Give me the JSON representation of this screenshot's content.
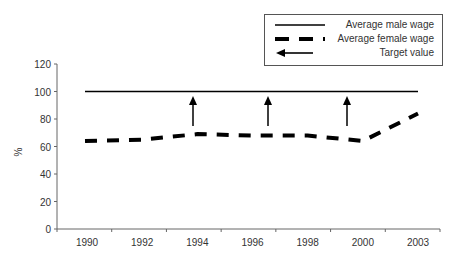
{
  "chart_data": {
    "type": "line",
    "title": "",
    "xlabel": "",
    "ylabel": "%",
    "ylim": [
      0,
      120
    ],
    "yticks": [
      0,
      20,
      40,
      60,
      80,
      100,
      120
    ],
    "categories": [
      "1990",
      "1992",
      "1994",
      "1996",
      "1998",
      "2000",
      "2003"
    ],
    "series": [
      {
        "name": "Average male wage",
        "style": "solid",
        "values": [
          100,
          100,
          100,
          100,
          100,
          100,
          100
        ]
      },
      {
        "name": "Average female wage",
        "style": "dashed",
        "values": [
          64,
          65,
          69,
          68,
          68,
          64,
          84
        ]
      }
    ],
    "annotations": [
      {
        "type": "arrow-up",
        "label": "Target value",
        "x_position": "1994",
        "from": 70,
        "to": 97
      },
      {
        "type": "arrow-up",
        "label": "Target value",
        "x_position": "between 1996 and 1998",
        "from": 70,
        "to": 97
      },
      {
        "type": "arrow-up",
        "label": "Target value",
        "x_position": "between 1998 and 2000",
        "from": 70,
        "to": 97
      }
    ],
    "grid": false,
    "legend_position": "top-right"
  },
  "legend": {
    "items": [
      {
        "label": "Average male wage",
        "icon": "solid-line-icon"
      },
      {
        "label": "Average female wage",
        "icon": "dashed-line-icon"
      },
      {
        "label": "Target value",
        "icon": "left-arrow-icon"
      }
    ]
  },
  "axis": {
    "y_title": "%",
    "y_ticks": [
      "0",
      "20",
      "40",
      "60",
      "80",
      "100",
      "120"
    ],
    "x_ticks": [
      "1990",
      "1992",
      "1994",
      "1996",
      "1998",
      "2000",
      "2003"
    ]
  },
  "colors": {
    "line": "#000000",
    "axis": "#666666",
    "text": "#333333"
  }
}
